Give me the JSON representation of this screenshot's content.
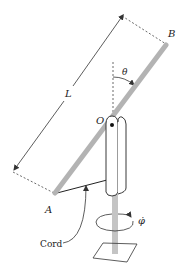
{
  "diagram": {
    "type": "mechanics-figure",
    "labels": {
      "length": "L",
      "end_top": "B",
      "end_bottom": "A",
      "pivot": "O",
      "angle": "θ",
      "spin_rate": "φ̇",
      "cord": "Cord"
    },
    "colors": {
      "rod": "#b3b3b3",
      "shaft": "#c4c4c4",
      "line": "#333333",
      "background": "#ffffff"
    }
  }
}
